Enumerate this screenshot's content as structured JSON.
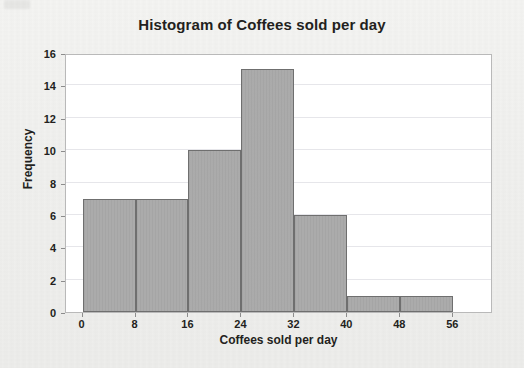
{
  "chart_data": {
    "type": "bar",
    "title": "Histogram of Coffees sold per day",
    "xlabel": "Coffees sold per day",
    "ylabel": "Frequency",
    "categories": [
      "0-8",
      "8-16",
      "16-24",
      "24-32",
      "32-40",
      "40-48",
      "48-56"
    ],
    "bin_edges": [
      0,
      8,
      16,
      24,
      32,
      40,
      48,
      56
    ],
    "values": [
      7,
      7,
      10,
      15,
      6,
      1,
      1
    ],
    "xlim": [
      -2.5,
      62
    ],
    "ylim": [
      0,
      16
    ],
    "xticks": [
      "0",
      "8",
      "16",
      "24",
      "32",
      "40",
      "48",
      "56"
    ],
    "xtick_values": [
      0,
      8,
      16,
      24,
      32,
      40,
      48,
      56
    ],
    "yticks": [
      "0",
      "2",
      "4",
      "6",
      "8",
      "10",
      "12",
      "14",
      "16"
    ],
    "ytick_values": [
      0,
      2,
      4,
      6,
      8,
      10,
      12,
      14,
      16
    ],
    "grid": true,
    "legend": null,
    "bar_fill_color": "#a9a9a9",
    "bar_edge_color": "#6f6f6f",
    "plot_background": "#ffffff",
    "page_background": "#f1f1ef",
    "text_color": "#231f20"
  }
}
